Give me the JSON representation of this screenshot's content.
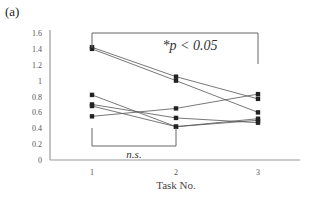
{
  "panel_label": "(a)",
  "chart_data": {
    "type": "line",
    "title": "",
    "xlabel": "Task No.",
    "ylabel": "",
    "categories": [
      "1",
      "2",
      "3"
    ],
    "x": [
      1,
      2,
      3
    ],
    "ylim": [
      0,
      1.6
    ],
    "yticks": [
      "0",
      "0.2",
      "0.4",
      "0.6",
      "0.8",
      "1",
      "1.2",
      "1.4",
      "1.6"
    ],
    "grid": false,
    "legend": null,
    "marker": "square",
    "series": [
      {
        "name": "subject-1",
        "values": [
          1.42,
          1.05,
          0.77
        ]
      },
      {
        "name": "subject-2",
        "values": [
          1.4,
          1.0,
          0.6
        ]
      },
      {
        "name": "subject-3",
        "values": [
          0.82,
          0.42,
          0.5
        ]
      },
      {
        "name": "subject-4",
        "values": [
          0.7,
          0.53,
          0.47
        ]
      },
      {
        "name": "subject-5",
        "values": [
          0.68,
          0.42,
          0.52
        ]
      },
      {
        "name": "subject-6",
        "values": [
          0.55,
          0.65,
          0.83
        ]
      }
    ],
    "annotations": [
      {
        "text": "*p < 0.05",
        "bracket": [
          1,
          3
        ],
        "position": "top"
      },
      {
        "text": "n.s.",
        "bracket": [
          1,
          2
        ],
        "position": "bottom"
      }
    ]
  }
}
